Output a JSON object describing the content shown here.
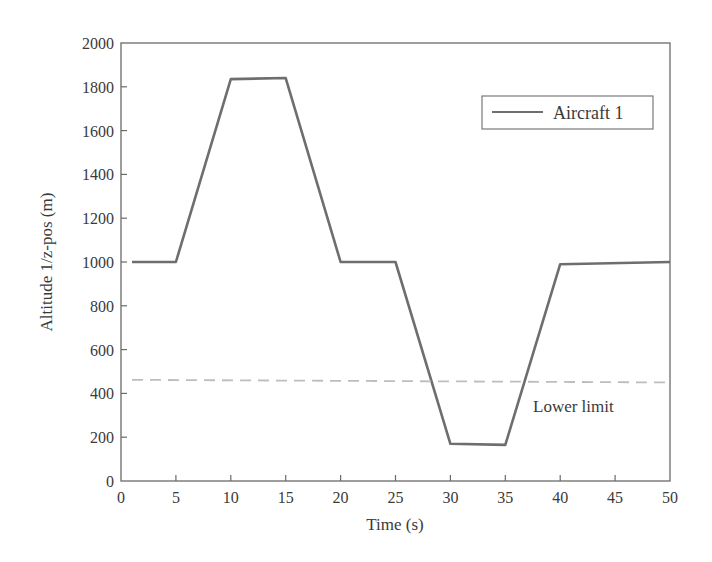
{
  "chart_data": {
    "type": "line",
    "title": "",
    "xlabel": "Time (s)",
    "ylabel": "Altitude 1/z-pos (m)",
    "xlim": [
      0,
      50
    ],
    "ylim": [
      0,
      2000
    ],
    "xticks": [
      0,
      5,
      10,
      15,
      20,
      25,
      30,
      35,
      40,
      45,
      50
    ],
    "yticks": [
      0,
      200,
      400,
      600,
      800,
      1000,
      1200,
      1400,
      1600,
      1800,
      2000
    ],
    "grid": false,
    "legend_position": "upper right",
    "series": [
      {
        "name": "Aircraft 1",
        "style": "solid",
        "color": "#6e6e6e",
        "x": [
          1,
          5,
          10,
          15,
          20,
          25,
          30,
          35,
          40,
          50
        ],
        "y": [
          1000,
          1000,
          1835,
          1840,
          1000,
          1000,
          170,
          165,
          990,
          1000
        ]
      },
      {
        "name": "Lower limit",
        "style": "dashed",
        "color": "#bdbdbd",
        "x": [
          1,
          50
        ],
        "y": [
          462,
          450
        ]
      }
    ],
    "annotations": [
      {
        "text": "Lower limit",
        "x": 37.5,
        "y": 340
      }
    ]
  },
  "labels": {
    "legend_entry": "Aircraft 1",
    "annotation": "Lower limit",
    "xlabel": "Time (s)",
    "ylabel": "Altitude 1/z-pos (m)"
  }
}
